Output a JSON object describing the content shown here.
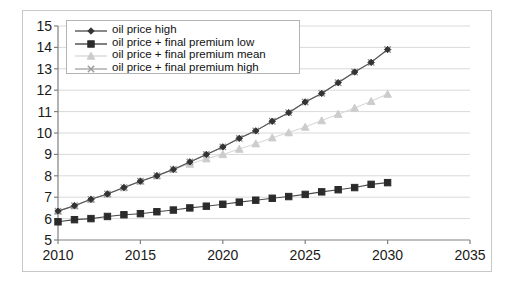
{
  "chart_data": {
    "type": "line",
    "title": "",
    "xlabel": "",
    "ylabel": "",
    "xlim": [
      2010,
      2035
    ],
    "ylim": [
      5,
      15
    ],
    "xticks": [
      "2010",
      "2015",
      "2020",
      "2025",
      "2030",
      "2035"
    ],
    "yticks": [
      "5",
      "6",
      "7",
      "8",
      "9",
      "10",
      "11",
      "12",
      "13",
      "14",
      "15"
    ],
    "grid": "horizontal",
    "legend_position": "top-left-inside",
    "x": [
      2010,
      2011,
      2012,
      2013,
      2014,
      2015,
      2016,
      2017,
      2018,
      2019,
      2020,
      2021,
      2022,
      2023,
      2024,
      2025,
      2026,
      2027,
      2028,
      2029,
      2030
    ],
    "series": [
      {
        "name": "oil price high",
        "marker": "diamond",
        "color": "#333333",
        "line_color": "#555555",
        "values": [
          6.35,
          6.6,
          6.9,
          7.15,
          7.45,
          7.75,
          8.0,
          8.3,
          8.65,
          9.0,
          9.35,
          9.75,
          10.1,
          10.55,
          10.95,
          11.45,
          11.85,
          12.35,
          12.85,
          13.3,
          13.9
        ]
      },
      {
        "name": "oil price + final premium low",
        "marker": "square",
        "color": "#2b2b2b",
        "line_color": "#4a4a4a",
        "values": [
          5.85,
          5.95,
          6.0,
          6.1,
          6.18,
          6.23,
          6.32,
          6.4,
          6.5,
          6.58,
          6.67,
          6.77,
          6.86,
          6.95,
          7.03,
          7.13,
          7.25,
          7.35,
          7.45,
          7.6,
          7.68
        ]
      },
      {
        "name": "oil price + final premium mean",
        "marker": "triangle",
        "color": "#cccccc",
        "line_color": "#d8d8d8",
        "values": [
          6.35,
          6.6,
          6.9,
          7.15,
          7.45,
          7.75,
          8.0,
          8.3,
          8.55,
          8.8,
          9.0,
          9.25,
          9.5,
          9.78,
          10.02,
          10.28,
          10.58,
          10.88,
          11.17,
          11.48,
          11.82
        ]
      },
      {
        "name": "oil price + final premium high",
        "marker": "x",
        "color": "#9a9a9a",
        "line_color": "#a8a8a8",
        "values": [
          6.35,
          6.6,
          6.9,
          7.15,
          7.45,
          7.75,
          8.0,
          8.3,
          8.65,
          9.0,
          9.35,
          9.75,
          10.1,
          10.55,
          10.95,
          11.45,
          11.85,
          12.35,
          12.85,
          13.3,
          13.9
        ]
      }
    ]
  },
  "legend": {
    "items": [
      {
        "label": "oil price high"
      },
      {
        "label": "oil price + final premium low"
      },
      {
        "label": "oil price + final premium mean"
      },
      {
        "label": "oil price + final premium high"
      }
    ]
  },
  "colors": {
    "frame": "#c8c8c8",
    "axis": "#808080",
    "gridline": "#d9d9d9",
    "background": "#ffffff"
  }
}
